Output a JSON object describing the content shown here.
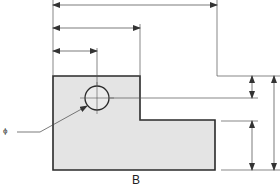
{
  "drawing": {
    "view_label": "B",
    "diameter_symbol": "ϕ",
    "colors": {
      "part_fill": "#e4e4e4",
      "outline": "#2a2a2a",
      "dim_line": "#555555"
    },
    "part_outline": [
      [
        53,
        76
      ],
      [
        140,
        76
      ],
      [
        140,
        120
      ],
      [
        215,
        120
      ],
      [
        215,
        170
      ],
      [
        53,
        170
      ]
    ],
    "hole": {
      "cx": 97,
      "cy": 98,
      "r": 12
    },
    "horizontal_dimensions": [
      {
        "y": 5,
        "x1": 53,
        "x2": 217
      },
      {
        "y": 28,
        "x1": 53,
        "x2": 140
      },
      {
        "y": 51,
        "x1": 53,
        "x2": 97
      }
    ],
    "vertical_dimensions": [
      {
        "x": 252,
        "y1": 76,
        "y2": 98
      },
      {
        "x": 252,
        "y1": 121,
        "y2": 170
      },
      {
        "x": 274,
        "y1": 76,
        "y2": 170
      }
    ]
  }
}
